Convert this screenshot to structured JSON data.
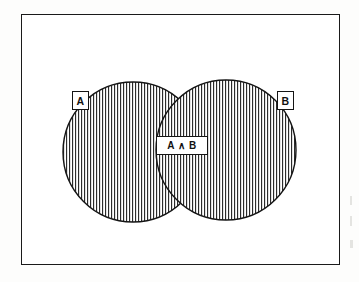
{
  "figure": {
    "kind": "venn-diagram",
    "title_text": "",
    "frame": {
      "name": "universe-rectangle",
      "x": 21,
      "y": 14,
      "width": 319,
      "height": 251,
      "border_color": "#1a1a1a",
      "fill_color": "#ffffff"
    },
    "colors": {
      "outline": "#141414",
      "hatch_line": "#2b2b2b",
      "plate_fill": "#ffffff",
      "page_background": "#fdfdfc"
    },
    "hatching": {
      "style": "vertical-lines",
      "spacing_px": 3,
      "line_width_px": 1,
      "color": "#2b2b2b"
    }
  },
  "sets": [
    {
      "id": "A",
      "label": "A",
      "shaded": true,
      "cx": 133,
      "cy": 152,
      "r": 70
    },
    {
      "id": "B",
      "label": "B",
      "shaded": true,
      "cx": 226,
      "cy": 150,
      "r": 70
    }
  ],
  "labels": {
    "set_a": "A",
    "set_b": "B",
    "intersection": "A ∧ B"
  },
  "chart_data": {
    "type": "diagram",
    "title": "",
    "xlabel": "",
    "ylabel": "",
    "regions": [
      {
        "name": "A only",
        "shaded": true
      },
      {
        "name": "A ∧ B",
        "shaded": true,
        "highlighted": true
      },
      {
        "name": "B only",
        "shaded": true
      },
      {
        "name": "outside A ∪ B",
        "shaded": false
      }
    ],
    "categories": [
      "A",
      "B",
      "A ∧ B"
    ],
    "values": [
      1,
      1,
      1
    ]
  }
}
